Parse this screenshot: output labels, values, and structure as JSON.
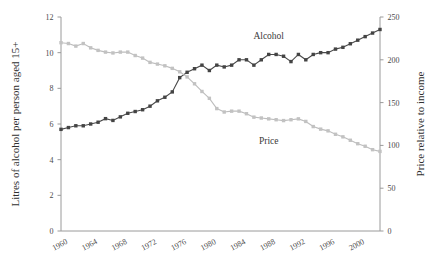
{
  "chart_data": {
    "type": "line",
    "title": "",
    "subtitle": "",
    "xlabel": "",
    "ylabel": "Litres of alcohol per person aged 15+",
    "y2label": "Price relative to income",
    "xlim": [
      1960,
      2003
    ],
    "ylim": [
      0,
      12
    ],
    "y2lim": [
      0,
      250
    ],
    "grid": false,
    "legend_position": "inline-annotation",
    "x_tick_labels": [
      "1960",
      "1964",
      "1968",
      "1972",
      "1976",
      "1980",
      "1984",
      "1988",
      "1992",
      "1996",
      "2000"
    ],
    "x_ticks": [
      1960,
      1964,
      1968,
      1972,
      1976,
      1980,
      1984,
      1988,
      1992,
      1996,
      2000
    ],
    "y_tick_labels": [
      "0",
      "2",
      "4",
      "6",
      "8",
      "10",
      "12"
    ],
    "y_ticks": [
      0,
      2,
      4,
      6,
      8,
      10,
      12
    ],
    "y2_tick_labels": [
      "0",
      "50",
      "100",
      "150",
      "200",
      "250"
    ],
    "y2_ticks": [
      0,
      50,
      100,
      150,
      200,
      250
    ],
    "x": [
      1960,
      1961,
      1962,
      1963,
      1964,
      1965,
      1966,
      1967,
      1968,
      1969,
      1970,
      1971,
      1972,
      1973,
      1974,
      1975,
      1976,
      1977,
      1978,
      1979,
      1980,
      1981,
      1982,
      1983,
      1984,
      1985,
      1986,
      1987,
      1988,
      1989,
      1990,
      1991,
      1992,
      1993,
      1994,
      1995,
      1996,
      1997,
      1998,
      1999,
      2000,
      2001,
      2002,
      2003
    ],
    "series": [
      {
        "name": "Alcohol",
        "axis": "left",
        "color": "#444444",
        "label_x": 1988,
        "label_y": 10.75,
        "values": [
          5.7,
          5.8,
          5.9,
          5.9,
          6.0,
          6.1,
          6.3,
          6.2,
          6.4,
          6.6,
          6.7,
          6.8,
          7.0,
          7.3,
          7.5,
          7.8,
          8.6,
          8.9,
          9.1,
          9.3,
          9.0,
          9.3,
          9.2,
          9.3,
          9.6,
          9.6,
          9.3,
          9.6,
          9.9,
          9.9,
          9.8,
          9.5,
          9.9,
          9.6,
          9.9,
          10.0,
          10.0,
          10.2,
          10.3,
          10.5,
          10.7,
          10.9,
          11.1,
          11.3
        ]
      },
      {
        "name": "Price",
        "axis": "right",
        "color": "#c2c2c2",
        "label_x": 1988,
        "label_y": 4.9,
        "values": [
          220,
          219,
          216,
          219,
          214,
          211,
          209,
          208,
          209,
          209,
          205,
          202,
          197,
          195,
          193,
          190,
          186,
          180,
          172,
          163,
          155,
          143,
          139,
          140,
          140,
          137,
          133,
          132,
          131,
          130,
          129,
          130,
          131,
          128,
          122,
          119,
          117,
          113,
          110,
          106,
          102,
          99,
          95,
          93
        ]
      }
    ],
    "crossover_note": "Alcohol and Price series cross near 1974",
    "left_axis_title": "Litres of alcohol per person aged 15+",
    "right_axis_title": "Price relative to income"
  }
}
